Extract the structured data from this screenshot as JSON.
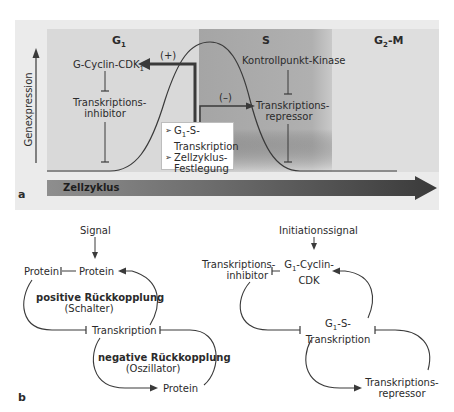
{
  "panel_a": {
    "label": "a",
    "y_axis_label": "Genexpression",
    "phases": [
      {
        "name": "G1",
        "base": "G",
        "sub": "1",
        "color": "#d9d9d9"
      },
      {
        "name": "S",
        "base": "S",
        "sub": "",
        "color": "#a8a8a8"
      },
      {
        "name": "G2-M",
        "base": "G",
        "sub": "2",
        "suffix": "-M",
        "color": "#dedede"
      }
    ],
    "g1_phase_label": "G",
    "g1_phase_sub": "1",
    "s_phase_label": "S",
    "g2m_phase_label": "G",
    "g2m_phase_sub": "2",
    "g2m_phase_suffix": "-M",
    "g_cyclin_label": "G-Cyclin-CDK",
    "g_cyclin_sub": "1",
    "inhibitor_line1": "Transkriptions-",
    "inhibitor_line2": "inhibitor",
    "kinase_label": "Kontrollpunkt-Kinase",
    "repressor_line1": "Transkriptions-",
    "repressor_line2": "repressor",
    "plus_label": "(+)",
    "minus_label": "(–)",
    "infobox": {
      "bullet": "➢",
      "item1_a": "G",
      "item1_sub": "1",
      "item1_b": "-S-",
      "item1_line2": "Transkription",
      "item2_line1": "Zellzyklus-",
      "item2_line2": "Festlegung"
    },
    "cell_cycle_arrow_label": "Zellzyklus"
  },
  "panel_b": {
    "label": "b",
    "left": {
      "signal": "Signal",
      "protein_left": "Protein",
      "protein_center": "Protein",
      "positive_title": "positive Rückkopplung",
      "positive_sub": "(Schalter)",
      "transcription": "Transkription",
      "negative_title": "negative Rückkopplung",
      "negative_sub": "(Oszillator)",
      "protein_bottom": "Protein"
    },
    "right": {
      "signal": "Initiationssignal",
      "inhibitor_line1": "Transkriptions-",
      "inhibitor_line2": "inhibitor",
      "cyclin_line1_a": "G",
      "cyclin_line1_sub": "1",
      "cyclin_line1_b": "-Cyclin-",
      "cyclin_line2": "CDK",
      "g1s_line1_a": "G",
      "g1s_line1_sub": "1",
      "g1s_line1_b": "-S-",
      "g1s_line2": "Transkription",
      "repressor_line1": "Transkriptions-",
      "repressor_line2": "repressor"
    }
  },
  "colors": {
    "panel_bg": "#ebebeb",
    "g1_bg": "#d9d9d9",
    "s_bg": "#a8a8a8",
    "g2m_bg": "#dedede",
    "line": "#3a3a3a",
    "arrow_dark": "#3c3c3c",
    "arrow_light": "#8a8a8a"
  }
}
